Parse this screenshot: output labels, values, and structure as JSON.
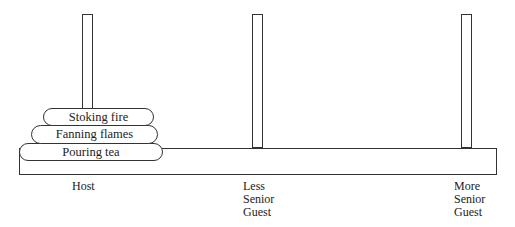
{
  "diagram": {
    "pegs": [
      {
        "name": "host"
      },
      {
        "name": "less-senior-guest"
      },
      {
        "name": "more-senior-guest"
      }
    ],
    "discs": [
      {
        "label": "Stoking fire"
      },
      {
        "label": "Fanning flames"
      },
      {
        "label": "Pouring tea"
      }
    ],
    "labels": {
      "host": "Host",
      "less_senior_1": "Less",
      "less_senior_2": "Senior",
      "less_senior_3": "Guest",
      "more_senior_1": "More",
      "more_senior_2": "Senior",
      "more_senior_3": "Guest"
    }
  }
}
